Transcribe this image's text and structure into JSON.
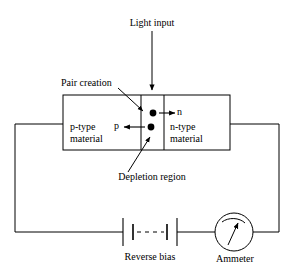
{
  "diagram": {
    "type": "circuit-schematic",
    "stroke_color": "#000000",
    "background_color": "#ffffff",
    "labels": {
      "light_input": "Light input",
      "pair_creation": "Pair creation",
      "p_type": {
        "line1": "p-type",
        "line2": "material"
      },
      "n_type": {
        "line1": "n-type",
        "line2": "material"
      },
      "carrier_p": "p",
      "carrier_n": "n",
      "depletion_region": "Depletion region",
      "reverse_bias": "Reverse bias",
      "ammeter": "Ammeter"
    },
    "components": [
      {
        "name": "photodiode",
        "label": "p-n junction"
      },
      {
        "name": "battery",
        "label": "Reverse bias"
      },
      {
        "name": "ammeter",
        "label": "Ammeter"
      }
    ]
  }
}
